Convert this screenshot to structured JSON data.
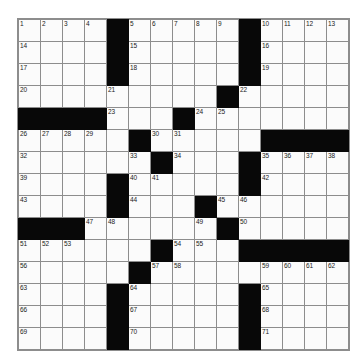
{
  "puzzle": {
    "title": "",
    "rows": 15,
    "cols": 14,
    "cell_size_px": 22,
    "colors": {
      "block": "#080808",
      "cell": "#fbfbfb",
      "grid_line": "#8d8d8d",
      "number_text": "#1a1a1a",
      "page_background": "#ffffff"
    },
    "grid": [
      [
        {
          "type": "open",
          "number": "1"
        },
        {
          "type": "open",
          "number": "2"
        },
        {
          "type": "open",
          "number": "3"
        },
        {
          "type": "open",
          "number": "4"
        },
        {
          "type": "block",
          "number": ""
        },
        {
          "type": "open",
          "number": "5"
        },
        {
          "type": "open",
          "number": "6"
        },
        {
          "type": "open",
          "number": "7"
        },
        {
          "type": "open",
          "number": "8"
        },
        {
          "type": "open",
          "number": "9"
        },
        {
          "type": "block",
          "number": ""
        },
        {
          "type": "open",
          "number": "10"
        },
        {
          "type": "open",
          "number": "11"
        },
        {
          "type": "open",
          "number": "12"
        },
        {
          "type": "open",
          "number": "13"
        }
      ],
      [
        {
          "type": "open",
          "number": "14"
        },
        {
          "type": "open",
          "number": ""
        },
        {
          "type": "open",
          "number": ""
        },
        {
          "type": "open",
          "number": ""
        },
        {
          "type": "block",
          "number": ""
        },
        {
          "type": "open",
          "number": "15"
        },
        {
          "type": "open",
          "number": ""
        },
        {
          "type": "open",
          "number": ""
        },
        {
          "type": "open",
          "number": ""
        },
        {
          "type": "open",
          "number": ""
        },
        {
          "type": "block",
          "number": ""
        },
        {
          "type": "open",
          "number": "16"
        },
        {
          "type": "open",
          "number": ""
        },
        {
          "type": "open",
          "number": ""
        },
        {
          "type": "open",
          "number": ""
        }
      ],
      [
        {
          "type": "open",
          "number": "17"
        },
        {
          "type": "open",
          "number": ""
        },
        {
          "type": "open",
          "number": ""
        },
        {
          "type": "open",
          "number": ""
        },
        {
          "type": "block",
          "number": ""
        },
        {
          "type": "open",
          "number": "18"
        },
        {
          "type": "open",
          "number": ""
        },
        {
          "type": "open",
          "number": ""
        },
        {
          "type": "open",
          "number": ""
        },
        {
          "type": "open",
          "number": ""
        },
        {
          "type": "block",
          "number": ""
        },
        {
          "type": "open",
          "number": "19"
        },
        {
          "type": "open",
          "number": ""
        },
        {
          "type": "open",
          "number": ""
        },
        {
          "type": "open",
          "number": ""
        }
      ],
      [
        {
          "type": "open",
          "number": "20"
        },
        {
          "type": "open",
          "number": ""
        },
        {
          "type": "open",
          "number": ""
        },
        {
          "type": "open",
          "number": ""
        },
        {
          "type": "open",
          "number": "21"
        },
        {
          "type": "open",
          "number": ""
        },
        {
          "type": "open",
          "number": ""
        },
        {
          "type": "open",
          "number": ""
        },
        {
          "type": "open",
          "number": ""
        },
        {
          "type": "block",
          "number": ""
        },
        {
          "type": "open",
          "number": "22"
        },
        {
          "type": "open",
          "number": ""
        },
        {
          "type": "open",
          "number": ""
        },
        {
          "type": "open",
          "number": ""
        },
        {
          "type": "open",
          "number": ""
        }
      ],
      [
        {
          "type": "block",
          "number": ""
        },
        {
          "type": "block",
          "number": ""
        },
        {
          "type": "block",
          "number": ""
        },
        {
          "type": "block",
          "number": ""
        },
        {
          "type": "open",
          "number": "23"
        },
        {
          "type": "open",
          "number": ""
        },
        {
          "type": "open",
          "number": ""
        },
        {
          "type": "block",
          "number": ""
        },
        {
          "type": "open",
          "number": "24"
        },
        {
          "type": "open",
          "number": "25"
        },
        {
          "type": "open",
          "number": ""
        },
        {
          "type": "open",
          "number": ""
        },
        {
          "type": "open",
          "number": ""
        },
        {
          "type": "open",
          "number": ""
        },
        {
          "type": "open",
          "number": ""
        }
      ],
      [
        {
          "type": "open",
          "number": "26"
        },
        {
          "type": "open",
          "number": "27"
        },
        {
          "type": "open",
          "number": "28"
        },
        {
          "type": "open",
          "number": "29"
        },
        {
          "type": "open",
          "number": ""
        },
        {
          "type": "block",
          "number": ""
        },
        {
          "type": "open",
          "number": "30"
        },
        {
          "type": "open",
          "number": "31"
        },
        {
          "type": "open",
          "number": ""
        },
        {
          "type": "open",
          "number": ""
        },
        {
          "type": "open",
          "number": ""
        },
        {
          "type": "block",
          "number": ""
        },
        {
          "type": "block",
          "number": ""
        },
        {
          "type": "block",
          "number": ""
        },
        {
          "type": "block",
          "number": ""
        }
      ],
      [
        {
          "type": "open",
          "number": "32"
        },
        {
          "type": "open",
          "number": ""
        },
        {
          "type": "open",
          "number": ""
        },
        {
          "type": "open",
          "number": ""
        },
        {
          "type": "open",
          "number": ""
        },
        {
          "type": "open",
          "number": "33"
        },
        {
          "type": "block",
          "number": ""
        },
        {
          "type": "open",
          "number": "34"
        },
        {
          "type": "open",
          "number": ""
        },
        {
          "type": "open",
          "number": ""
        },
        {
          "type": "block",
          "number": ""
        },
        {
          "type": "open",
          "number": "35"
        },
        {
          "type": "open",
          "number": "36"
        },
        {
          "type": "open",
          "number": "37"
        },
        {
          "type": "open",
          "number": "38"
        }
      ],
      [
        {
          "type": "open",
          "number": "39"
        },
        {
          "type": "open",
          "number": ""
        },
        {
          "type": "open",
          "number": ""
        },
        {
          "type": "open",
          "number": ""
        },
        {
          "type": "block",
          "number": ""
        },
        {
          "type": "open",
          "number": "40"
        },
        {
          "type": "open",
          "number": "41"
        },
        {
          "type": "open",
          "number": ""
        },
        {
          "type": "open",
          "number": ""
        },
        {
          "type": "open",
          "number": ""
        },
        {
          "type": "block",
          "number": ""
        },
        {
          "type": "open",
          "number": "42"
        },
        {
          "type": "open",
          "number": ""
        },
        {
          "type": "open",
          "number": ""
        },
        {
          "type": "open",
          "number": ""
        }
      ],
      [
        {
          "type": "open",
          "number": "43"
        },
        {
          "type": "open",
          "number": ""
        },
        {
          "type": "open",
          "number": ""
        },
        {
          "type": "open",
          "number": ""
        },
        {
          "type": "block",
          "number": ""
        },
        {
          "type": "open",
          "number": "44"
        },
        {
          "type": "open",
          "number": ""
        },
        {
          "type": "open",
          "number": ""
        },
        {
          "type": "block",
          "number": ""
        },
        {
          "type": "open",
          "number": "45"
        },
        {
          "type": "open",
          "number": "46"
        },
        {
          "type": "open",
          "number": ""
        },
        {
          "type": "open",
          "number": ""
        },
        {
          "type": "open",
          "number": ""
        },
        {
          "type": "open",
          "number": ""
        }
      ],
      [
        {
          "type": "block",
          "number": ""
        },
        {
          "type": "block",
          "number": ""
        },
        {
          "type": "block",
          "number": ""
        },
        {
          "type": "open",
          "number": "47"
        },
        {
          "type": "open",
          "number": "48"
        },
        {
          "type": "open",
          "number": ""
        },
        {
          "type": "open",
          "number": ""
        },
        {
          "type": "open",
          "number": ""
        },
        {
          "type": "open",
          "number": "49"
        },
        {
          "type": "block",
          "number": ""
        },
        {
          "type": "open",
          "number": "50"
        },
        {
          "type": "open",
          "number": ""
        },
        {
          "type": "open",
          "number": ""
        },
        {
          "type": "open",
          "number": ""
        },
        {
          "type": "open",
          "number": ""
        }
      ],
      [
        {
          "type": "open",
          "number": "51"
        },
        {
          "type": "open",
          "number": "52"
        },
        {
          "type": "open",
          "number": "53"
        },
        {
          "type": "open",
          "number": ""
        },
        {
          "type": "open",
          "number": ""
        },
        {
          "type": "open",
          "number": ""
        },
        {
          "type": "block",
          "number": ""
        },
        {
          "type": "open",
          "number": "54"
        },
        {
          "type": "open",
          "number": "55"
        },
        {
          "type": "open",
          "number": ""
        },
        {
          "type": "block",
          "number": ""
        },
        {
          "type": "block",
          "number": ""
        },
        {
          "type": "block",
          "number": ""
        },
        {
          "type": "block",
          "number": ""
        },
        {
          "type": "block",
          "number": ""
        }
      ],
      [
        {
          "type": "open",
          "number": "56"
        },
        {
          "type": "open",
          "number": ""
        },
        {
          "type": "open",
          "number": ""
        },
        {
          "type": "open",
          "number": ""
        },
        {
          "type": "open",
          "number": ""
        },
        {
          "type": "block",
          "number": ""
        },
        {
          "type": "open",
          "number": "57"
        },
        {
          "type": "open",
          "number": "58"
        },
        {
          "type": "open",
          "number": ""
        },
        {
          "type": "open",
          "number": ""
        },
        {
          "type": "open",
          "number": ""
        },
        {
          "type": "open",
          "number": "59"
        },
        {
          "type": "open",
          "number": "60"
        },
        {
          "type": "open",
          "number": "61"
        },
        {
          "type": "open",
          "number": "62"
        }
      ],
      [
        {
          "type": "open",
          "number": "63"
        },
        {
          "type": "open",
          "number": ""
        },
        {
          "type": "open",
          "number": ""
        },
        {
          "type": "open",
          "number": ""
        },
        {
          "type": "block",
          "number": ""
        },
        {
          "type": "open",
          "number": "64"
        },
        {
          "type": "open",
          "number": ""
        },
        {
          "type": "open",
          "number": ""
        },
        {
          "type": "open",
          "number": ""
        },
        {
          "type": "open",
          "number": ""
        },
        {
          "type": "block",
          "number": ""
        },
        {
          "type": "open",
          "number": "65"
        },
        {
          "type": "open",
          "number": ""
        },
        {
          "type": "open",
          "number": ""
        },
        {
          "type": "open",
          "number": ""
        }
      ],
      [
        {
          "type": "open",
          "number": "66"
        },
        {
          "type": "open",
          "number": ""
        },
        {
          "type": "open",
          "number": ""
        },
        {
          "type": "open",
          "number": ""
        },
        {
          "type": "block",
          "number": ""
        },
        {
          "type": "open",
          "number": "67"
        },
        {
          "type": "open",
          "number": ""
        },
        {
          "type": "open",
          "number": ""
        },
        {
          "type": "open",
          "number": ""
        },
        {
          "type": "open",
          "number": ""
        },
        {
          "type": "block",
          "number": ""
        },
        {
          "type": "open",
          "number": "68"
        },
        {
          "type": "open",
          "number": ""
        },
        {
          "type": "open",
          "number": ""
        },
        {
          "type": "open",
          "number": ""
        }
      ],
      [
        {
          "type": "open",
          "number": "69"
        },
        {
          "type": "open",
          "number": ""
        },
        {
          "type": "open",
          "number": ""
        },
        {
          "type": "open",
          "number": ""
        },
        {
          "type": "block",
          "number": ""
        },
        {
          "type": "open",
          "number": "70"
        },
        {
          "type": "open",
          "number": ""
        },
        {
          "type": "open",
          "number": ""
        },
        {
          "type": "open",
          "number": ""
        },
        {
          "type": "open",
          "number": ""
        },
        {
          "type": "block",
          "number": ""
        },
        {
          "type": "open",
          "number": "71"
        },
        {
          "type": "open",
          "number": ""
        },
        {
          "type": "open",
          "number": ""
        },
        {
          "type": "open",
          "number": ""
        }
      ]
    ]
  }
}
